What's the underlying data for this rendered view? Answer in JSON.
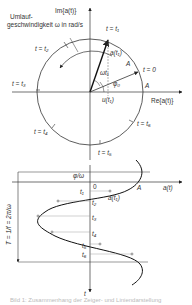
{
  "phasor_diagram": {
    "im_axis_label": "Im{a(t)}",
    "re_axis_label": "Re{a(t)}",
    "speed_label_line1": "Umlauf-",
    "speed_label_line2": "geschwindigkeit ω in rad/s",
    "phasor_label": "a(t₁)",
    "amplitude_phasor_label": "A",
    "amplitude_label": "A",
    "angle_omega_t_label": "ωt₁",
    "phase_label": "φ₀",
    "projection_label": "u(t₁)",
    "time_markers": [
      {
        "label": "t = t₁"
      },
      {
        "label": "t = 0"
      },
      {
        "label": "t = t₂"
      },
      {
        "label": "t = t₃"
      },
      {
        "label": "t = t₄"
      },
      {
        "label": "t = t₅"
      },
      {
        "label": "t = t₆"
      }
    ]
  },
  "line_diagram": {
    "phase_offset_label": "φ/ω",
    "origin_label": "0",
    "amplitude_label": "A",
    "value_axis_label": "a(t)",
    "point_label": "a(t₁)",
    "time_axis_label": "t",
    "period_label": "T = 1/f = 2π/ω",
    "time_ticks": [
      "t₁",
      "t₂",
      "t₃",
      "t₄",
      "t₅",
      "t₆"
    ]
  },
  "caption": "Bild 1: Zusammenhang der Zeiger- und Liniendarstellung"
}
